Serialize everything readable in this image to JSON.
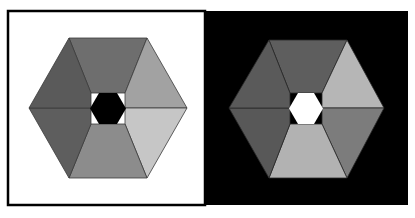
{
  "figure": {
    "width": 415,
    "height": 218,
    "panels": [
      {
        "id": "left",
        "background": "#ffffff",
        "border": "#000000",
        "center_color": "#000000",
        "segment_colors": {
          "top": "#6e6e6e",
          "top_right": "#a2a2a2",
          "bottom_right": "#c6c6c6",
          "bottom": "#8c8c8c",
          "bottom_left": "#5e5e5e",
          "top_left": "#5a5a5a"
        }
      },
      {
        "id": "right",
        "background": "#000000",
        "border": "#000000",
        "center_color": "#ffffff",
        "segment_colors": {
          "top": "#5e5e5e",
          "top_right": "#b6b6b6",
          "bottom_right": "#7c7c7c",
          "bottom": "#b2b2b2",
          "bottom_left": "#585858",
          "top_left": "#5a5a5a"
        }
      }
    ]
  }
}
